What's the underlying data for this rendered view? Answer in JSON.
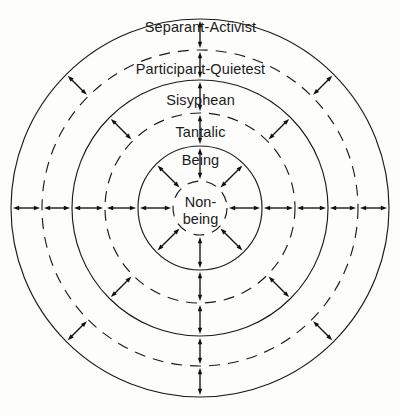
{
  "diagram": {
    "type": "concentric-rings",
    "center": {
      "x": 200,
      "y": 208
    },
    "canvas": {
      "width": 401,
      "height": 417
    },
    "rings": [
      {
        "id": "non-being",
        "label": "Non-being",
        "label_line1": "Non-",
        "label_line2": "being",
        "radius": 27,
        "stroke": "dashed",
        "level": 0
      },
      {
        "id": "being",
        "label": "Being",
        "radius": 62,
        "stroke": "solid",
        "level": 1
      },
      {
        "id": "tantalic",
        "label": "Tantalic",
        "radius": 95,
        "stroke": "dashed",
        "level": 2
      },
      {
        "id": "sisyphean",
        "label": "Sisyphean",
        "radius": 128,
        "stroke": "solid",
        "level": 3
      },
      {
        "id": "participant-quietest",
        "label": "Participant-Quietest",
        "radius": 158,
        "stroke": "dashed",
        "level": 4
      },
      {
        "id": "separant-activist",
        "label": "Separant-Activist",
        "radius": 189,
        "stroke": "solid",
        "level": 5
      }
    ],
    "arrows": {
      "style": "double-headed",
      "color": "#111111",
      "description": "Double-headed arrows span the gap between each pair of adjacent circles",
      "gaps": [
        {
          "id": "gap-nonbeing-being",
          "inner_radius": 27,
          "outer_radius": 62,
          "angles_deg": [
            0,
            45,
            90,
            135,
            180,
            225,
            270,
            315
          ]
        },
        {
          "id": "gap-being-tantalic",
          "inner_radius": 62,
          "outer_radius": 95,
          "angles_deg": [
            0,
            90,
            180,
            270
          ]
        },
        {
          "id": "gap-tantalic-sisyphean",
          "inner_radius": 95,
          "outer_radius": 128,
          "angles_deg": [
            0,
            45,
            90,
            135,
            180,
            225,
            270,
            315
          ]
        },
        {
          "id": "gap-sisyphean-participant",
          "inner_radius": 128,
          "outer_radius": 158,
          "angles_deg": [
            0,
            90,
            180,
            270
          ]
        },
        {
          "id": "gap-participant-separant",
          "inner_radius": 158,
          "outer_radius": 189,
          "angles_deg": [
            0,
            45,
            90,
            135,
            180,
            225,
            270,
            315
          ]
        }
      ]
    },
    "colors": {
      "stroke": "#1a1a1a",
      "text": "#1b1b1b",
      "background": "#fdfdfc"
    }
  }
}
